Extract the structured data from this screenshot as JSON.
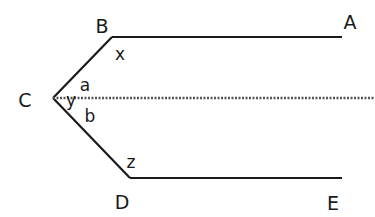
{
  "diagram": {
    "colors": {
      "line": "#1a1a1a",
      "dashed": "#555555",
      "background": "#ffffff"
    },
    "points": {
      "A": {
        "label": "A",
        "x": 342,
        "y": 37
      },
      "B": {
        "label": "B",
        "x": 112,
        "y": 37
      },
      "C": {
        "label": "C",
        "x": 53,
        "y": 98
      },
      "D": {
        "label": "D",
        "x": 130,
        "y": 178
      },
      "E": {
        "label": "E",
        "x": 342,
        "y": 178
      }
    },
    "segments": [
      {
        "from": "B",
        "to": "A",
        "style": "solid"
      },
      {
        "from": "B",
        "to": "C",
        "style": "solid"
      },
      {
        "from": "C",
        "to": "D",
        "style": "solid"
      },
      {
        "from": "D",
        "to": "E",
        "style": "solid"
      }
    ],
    "dashed_line": {
      "from": "C",
      "x2": 375,
      "y": 98,
      "style": "dashed",
      "note": "parallel to AB and DE"
    },
    "angle_labels": {
      "x": {
        "label": "x",
        "at": "B"
      },
      "y": {
        "label": "y",
        "at": "C"
      },
      "a": {
        "label": "a",
        "at": "C (upper)"
      },
      "b": {
        "label": "b",
        "at": "C (lower)"
      },
      "z": {
        "label": "z",
        "at": "D"
      }
    }
  }
}
